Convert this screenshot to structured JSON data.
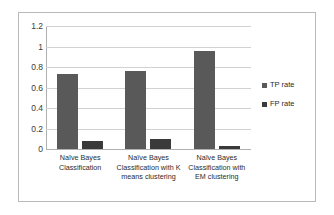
{
  "chart_data": {
    "type": "bar",
    "title": "",
    "subtitle": "",
    "xlabel": "",
    "ylabel": "",
    "ylim": [
      0,
      1.2
    ],
    "ytick_labels": [
      "1.2",
      "1",
      "0.8",
      "0.6",
      "0.4",
      "0.2",
      "0"
    ],
    "ytick_values": [
      1.2,
      1,
      0.8,
      0.6,
      0.4,
      0.2,
      0
    ],
    "grid": true,
    "legend_position": "right",
    "categories": [
      "Naïve Bayes Classification",
      "Naïve Bayes Classification with K means clustering",
      "Naïve Bayes Classification with EM clustering"
    ],
    "category_lines": [
      [
        "Naïve Bayes",
        "Classification"
      ],
      [
        "Naïve Bayes",
        "Classification with K",
        "means clustering"
      ],
      [
        "Naïve Bayes",
        "Classification with",
        "EM clustering"
      ]
    ],
    "series": [
      {
        "name": "TP rate",
        "color": "#595959",
        "values": [
          0.73,
          0.76,
          0.96
        ]
      },
      {
        "name": "FP rate",
        "color": "#3a3a3a",
        "values": [
          0.08,
          0.1,
          0.03
        ]
      }
    ]
  },
  "legend": {
    "items": [
      {
        "label": "TP rate"
      },
      {
        "label": "FP rate"
      }
    ]
  }
}
